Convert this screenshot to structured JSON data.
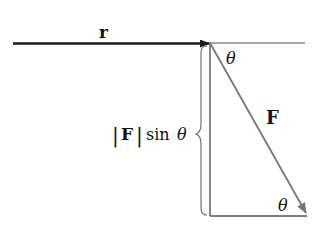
{
  "diagram": {
    "labels": {
      "r": "r",
      "F": "F",
      "theta_top": "θ",
      "theta_bottom": "θ",
      "magnitude_bar_left": "|",
      "magnitude_F": "F",
      "magnitude_bar_right": "|",
      "sin": "sin",
      "sin_theta": "θ"
    },
    "colors": {
      "r_vector": "#1a1a1a",
      "lines": "#555555",
      "F_vector": "#777777"
    }
  }
}
